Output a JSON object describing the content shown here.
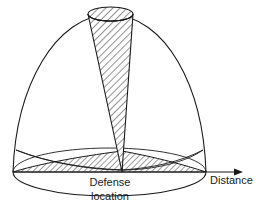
{
  "figure": {
    "type": "technical-diagram",
    "background_color": "#ffffff",
    "stroke_color": "#1a1a1a",
    "hatch_color": "#444444",
    "labels": {
      "defense_location_line1": "Defense",
      "defense_location_line2": "location",
      "distance_axis": "Distance"
    },
    "geometry": {
      "origin_x": 122,
      "origin_y": 172,
      "baseline_y": 172,
      "baseline_left_x": 13,
      "baseline_right_x": 243,
      "dome_left_x": 13,
      "dome_right_x": 206,
      "dome_apex_y": 14,
      "base_ellipse_cx": 109.5,
      "base_ellipse_cy": 172,
      "base_ellipse_rx": 96.5,
      "base_ellipse_ry": 24,
      "top_cap_cx": 110.5,
      "top_cap_cy": 14,
      "top_cap_rx": 22.5,
      "top_cap_ry": 7,
      "inner_ellipse_rx": 93,
      "inner_ellipse_ry": 22,
      "wedge_ellipse_cy": 150,
      "arrow_tip_x": 243,
      "arrow_tip_y": 172
    },
    "elements": [
      "outer-dome-outline",
      "base-ellipse",
      "narrow-cone-hatched",
      "cone-top-cap-hatched",
      "left-wedge-hatched",
      "right-wedge-hatched",
      "distance-axis-arrow"
    ]
  }
}
